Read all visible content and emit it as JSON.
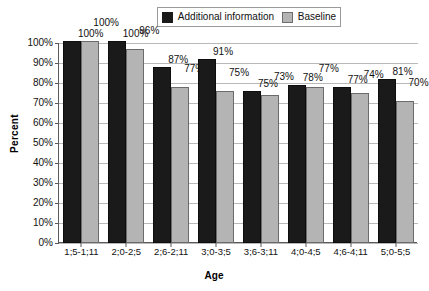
{
  "chart_data": {
    "type": "bar",
    "title": "",
    "xlabel": "Age",
    "ylabel": "Percent",
    "ylim": [
      0,
      100
    ],
    "ytick_labels": [
      "100%",
      "90%",
      "80%",
      "70%",
      "60%",
      "50%",
      "40%",
      "30%",
      "20%",
      "10%",
      "0%"
    ],
    "ytick_values": [
      100,
      90,
      80,
      70,
      60,
      50,
      40,
      30,
      20,
      10,
      0
    ],
    "grid": true,
    "legend_position": "top-center",
    "categories": [
      "1;5-1;11",
      "2;0-2;5",
      "2;6-2;11",
      "3;0-3;5",
      "3;6-3;11",
      "4;0-4;5",
      "4;6-4;11",
      "5;0-5;5"
    ],
    "series": [
      {
        "name": "Additional information",
        "color": "#1a1a1a",
        "values": [
          100,
          100,
          87,
          91,
          75,
          78,
          77,
          81
        ],
        "labels": [
          "100%",
          "100%",
          "87%",
          "91%",
          "75%",
          "78%",
          "77%",
          "81%"
        ]
      },
      {
        "name": "Baseline",
        "color": "#b4b4b4",
        "values": [
          100,
          96,
          77,
          75,
          73,
          77,
          74,
          70
        ],
        "labels": [
          "100%",
          "96%",
          "77%",
          "75%",
          "73%",
          "77%",
          "74%",
          "70%"
        ]
      }
    ]
  },
  "legend": {
    "entries": [
      {
        "label": "Additional information",
        "swatch": "dark-square-icon"
      },
      {
        "label": "Baseline",
        "swatch": "light-square-icon"
      }
    ]
  }
}
